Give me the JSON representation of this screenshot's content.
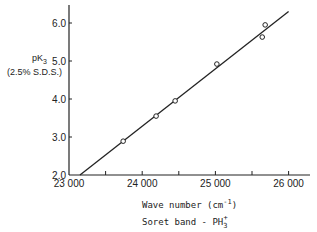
{
  "chart_data": {
    "type": "scatter",
    "title": "",
    "xlabel": "Wave number (cm-1)",
    "xlabel_sub": "Soret band - PH3+",
    "ylabel": "pK3",
    "ylabel_sub": "(2.5% S.D.S.)",
    "xlim": [
      23000,
      26250
    ],
    "ylim": [
      2.0,
      6.5
    ],
    "x_ticks": [
      "23 000",
      "24 000",
      "25 000",
      "26 000"
    ],
    "y_ticks": [
      "2.0",
      "3.0",
      "4.0",
      "5.0",
      "6.0"
    ],
    "grid": false,
    "series": [
      {
        "name": "observed",
        "marker": "open-circle",
        "x": [
          23740,
          24190,
          24450,
          25020,
          25640,
          25680
        ],
        "y": [
          2.89,
          3.55,
          3.95,
          4.92,
          5.63,
          5.95
        ]
      },
      {
        "name": "fit",
        "style": "line",
        "x": [
          23150,
          26000
        ],
        "y": [
          2.0,
          6.3
        ]
      }
    ]
  },
  "labels": {
    "y_main": "pK",
    "y_sub_index": "3",
    "y_paren": "(2.5% S.D.S.)",
    "x_main": "Wave number  (cm",
    "x_sup": "-1",
    "x_close": ")",
    "x_sub": "Soret band  - PH",
    "x_sub_index": "3",
    "x_sub_sup": "+"
  }
}
